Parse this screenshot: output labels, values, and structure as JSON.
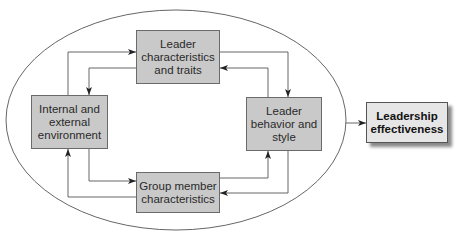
{
  "diagram": {
    "boxes": {
      "traits": "Leader\ncharacteristics\nand traits",
      "environment": "Internal and\nexternal\nenvironment",
      "behavior": "Leader\nbehavior and\nstyle",
      "group": "Group member\ncharacteristics",
      "effectiveness": "Leadership\neffectiveness"
    },
    "colors": {
      "box_fill": "#c9c9c9",
      "outcome_fill": "#e6e6e6",
      "line": "#444444"
    }
  }
}
